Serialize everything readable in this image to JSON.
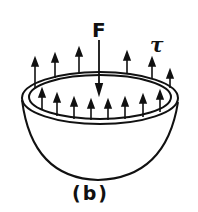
{
  "diagram": {
    "force_label": "F",
    "stress_label": "τ",
    "caption": "(b)",
    "shape": "hemispherical shell",
    "stroke_color": "#111111"
  }
}
